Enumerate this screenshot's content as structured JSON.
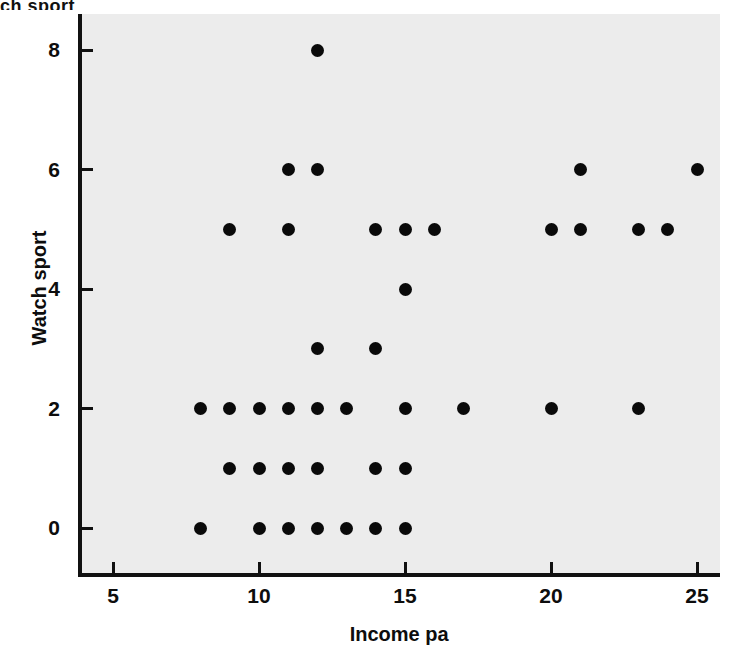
{
  "figure": {
    "background_color": "#ffffff",
    "plot_background_color": "#ececec",
    "marker_color": "#0a0a0a",
    "axis_color": "#111111",
    "partial_top_text": "ch sport"
  },
  "chart_data": {
    "type": "scatter",
    "title": "",
    "xlabel": "Income pa",
    "ylabel": "Watch sport",
    "xlim": [
      3.8,
      25.8
    ],
    "ylim": [
      -0.75,
      8.6
    ],
    "xticks": [
      5,
      10,
      15,
      20,
      25
    ],
    "yticks": [
      0,
      2,
      4,
      6,
      8
    ],
    "xtick_labels": [
      "5",
      "10",
      "15",
      "20",
      "25"
    ],
    "ytick_labels": [
      "0",
      "2",
      "4",
      "6",
      "8"
    ],
    "grid": false,
    "legend": null,
    "points": [
      {
        "x": 8,
        "y": 0
      },
      {
        "x": 10,
        "y": 0
      },
      {
        "x": 11,
        "y": 0
      },
      {
        "x": 12,
        "y": 0
      },
      {
        "x": 13,
        "y": 0
      },
      {
        "x": 14,
        "y": 0
      },
      {
        "x": 15,
        "y": 0
      },
      {
        "x": 9,
        "y": 1
      },
      {
        "x": 10,
        "y": 1
      },
      {
        "x": 11,
        "y": 1
      },
      {
        "x": 12,
        "y": 1
      },
      {
        "x": 14,
        "y": 1
      },
      {
        "x": 15,
        "y": 1
      },
      {
        "x": 8,
        "y": 2
      },
      {
        "x": 9,
        "y": 2
      },
      {
        "x": 10,
        "y": 2
      },
      {
        "x": 11,
        "y": 2
      },
      {
        "x": 12,
        "y": 2
      },
      {
        "x": 13,
        "y": 2
      },
      {
        "x": 15,
        "y": 2
      },
      {
        "x": 17,
        "y": 2
      },
      {
        "x": 20,
        "y": 2
      },
      {
        "x": 23,
        "y": 2
      },
      {
        "x": 12,
        "y": 3
      },
      {
        "x": 14,
        "y": 3
      },
      {
        "x": 15,
        "y": 4
      },
      {
        "x": 9,
        "y": 5
      },
      {
        "x": 11,
        "y": 5
      },
      {
        "x": 14,
        "y": 5
      },
      {
        "x": 15,
        "y": 5
      },
      {
        "x": 16,
        "y": 5
      },
      {
        "x": 20,
        "y": 5
      },
      {
        "x": 21,
        "y": 5
      },
      {
        "x": 23,
        "y": 5
      },
      {
        "x": 24,
        "y": 5
      },
      {
        "x": 11,
        "y": 6
      },
      {
        "x": 12,
        "y": 6
      },
      {
        "x": 21,
        "y": 6
      },
      {
        "x": 25,
        "y": 6
      },
      {
        "x": 12,
        "y": 8
      }
    ]
  }
}
